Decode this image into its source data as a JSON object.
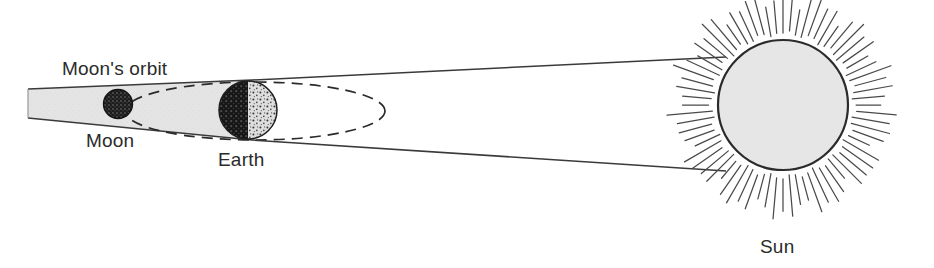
{
  "diagram": {
    "type": "astronomy-schematic",
    "background_color": "#ffffff",
    "ink_color": "#2b2b2b",
    "labels": {
      "moons_orbit": "Moon's orbit",
      "moon": "Moon",
      "earth": "Earth",
      "sun": "Sun"
    },
    "bodies": {
      "sun": {
        "name": "Sun",
        "cx": 783,
        "cy": 105,
        "r": 65,
        "fill": "#e6e6e6",
        "stroke": "#2b2b2b",
        "ray_count": 72,
        "ray_inner_radius": 72,
        "ray_outer_min": 95,
        "ray_outer_max": 118,
        "ray_color": "#4a4a4a"
      },
      "earth": {
        "name": "Earth",
        "cx": 248,
        "cy": 110,
        "r": 29,
        "night_side": "left",
        "day_fill": "#d8d8d8",
        "night_fill": "#1a1a1a",
        "stroke": "#2b2b2b"
      },
      "moon": {
        "name": "Moon",
        "cx": 118,
        "cy": 104,
        "r": 14,
        "fill": "#2a2a2a",
        "stroke": "#1a1a1a"
      }
    },
    "shadow_cone": {
      "name": "Earth umbra",
      "fill": "#e4e4e4",
      "stroke": "#3a3a3a",
      "apex_x": 28,
      "top_left_y": 89,
      "bottom_left_y": 118,
      "top_right_y": 80,
      "bottom_right_y": 140,
      "right_x": 252
    },
    "orbit_ellipse": {
      "name": "Moon's orbit",
      "cx": 255,
      "cy": 111,
      "rx": 130,
      "ry": 29,
      "dash": "10 7",
      "stroke": "#2b2b2b"
    },
    "tangent_rays": [
      {
        "name": "upper-tangent",
        "x1": 252,
        "y1": 80,
        "x2": 724,
        "y2": 58
      },
      {
        "name": "lower-tangent",
        "x1": 252,
        "y1": 140,
        "x2": 724,
        "y2": 170
      }
    ]
  }
}
